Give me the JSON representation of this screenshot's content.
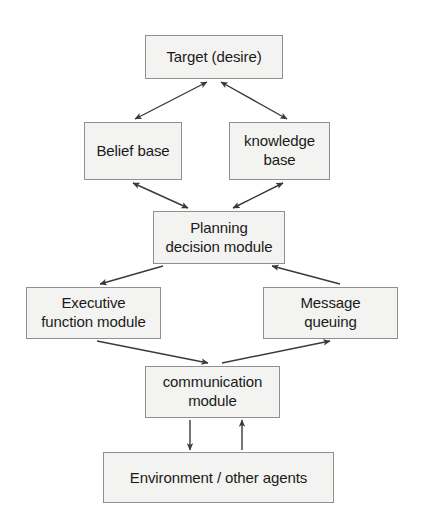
{
  "diagram": {
    "background_color": "#ffffff",
    "node_fill_color": "#f3f3f1",
    "node_border_color": "#8f8f8f",
    "edge_color": "#3a3a3a",
    "text_color": "#1a1a1a",
    "nodes": [
      {
        "id": "target",
        "label": "Target (desire)",
        "x": 145,
        "y": 35,
        "w": 138,
        "h": 44,
        "font_size": 15
      },
      {
        "id": "belief-base",
        "label": "Belief base",
        "x": 84,
        "y": 122,
        "w": 98,
        "h": 58,
        "font_size": 15
      },
      {
        "id": "knowledge-base",
        "label": "knowledge\nbase",
        "x": 229,
        "y": 122,
        "w": 101,
        "h": 58,
        "font_size": 15
      },
      {
        "id": "planning-decision-module",
        "label": "Planning\ndecision module",
        "x": 153,
        "y": 211,
        "w": 132,
        "h": 53,
        "font_size": 15
      },
      {
        "id": "executive-function-module",
        "label": "Executive\nfunction module",
        "x": 26,
        "y": 287,
        "w": 135,
        "h": 52,
        "font_size": 15
      },
      {
        "id": "message-queuing",
        "label": "Message\nqueuing",
        "x": 263,
        "y": 287,
        "w": 135,
        "h": 52,
        "font_size": 15
      },
      {
        "id": "communication-module",
        "label": "communication\nmodule",
        "x": 145,
        "y": 366,
        "w": 135,
        "h": 52,
        "font_size": 15
      },
      {
        "id": "environment-other-agents",
        "label": "Environment / other agents",
        "x": 103,
        "y": 452,
        "w": 231,
        "h": 51,
        "font_size": 15
      }
    ],
    "edges": [
      {
        "id": "target-belief",
        "from": "target",
        "to": "belief-base",
        "direction": "bidirectional",
        "x1": 207,
        "y1": 82,
        "x2": 135,
        "y2": 119
      },
      {
        "id": "target-knowledge",
        "from": "target",
        "to": "knowledge-base",
        "direction": "bidirectional",
        "x1": 221,
        "y1": 82,
        "x2": 287,
        "y2": 119
      },
      {
        "id": "belief-planning",
        "from": "belief-base",
        "to": "planning-decision-module",
        "direction": "bidirectional",
        "x1": 133,
        "y1": 183,
        "x2": 188,
        "y2": 208
      },
      {
        "id": "knowledge-planning",
        "from": "knowledge-base",
        "to": "planning-decision-module",
        "direction": "bidirectional",
        "x1": 283,
        "y1": 183,
        "x2": 233,
        "y2": 208
      },
      {
        "id": "planning-executive",
        "from": "planning-decision-module",
        "to": "executive-function-module",
        "direction": "single",
        "x1": 163,
        "y1": 266,
        "x2": 100,
        "y2": 284
      },
      {
        "id": "message-planning",
        "from": "message-queuing",
        "to": "planning-decision-module",
        "direction": "single",
        "x1": 340,
        "y1": 284,
        "x2": 272,
        "y2": 266
      },
      {
        "id": "executive-communication",
        "from": "executive-function-module",
        "to": "communication-module",
        "direction": "single",
        "x1": 97,
        "y1": 341,
        "x2": 208,
        "y2": 363
      },
      {
        "id": "communication-message",
        "from": "communication-module",
        "to": "message-queuing",
        "direction": "single",
        "x1": 222,
        "y1": 363,
        "x2": 330,
        "y2": 341
      },
      {
        "id": "communication-environment",
        "from": "communication-module",
        "to": "environment-other-agents",
        "direction": "single",
        "x1": 190,
        "y1": 420,
        "x2": 190,
        "y2": 450
      },
      {
        "id": "environment-communication",
        "from": "environment-other-agents",
        "to": "communication-module",
        "direction": "single",
        "x1": 242,
        "y1": 450,
        "x2": 242,
        "y2": 420
      }
    ]
  }
}
